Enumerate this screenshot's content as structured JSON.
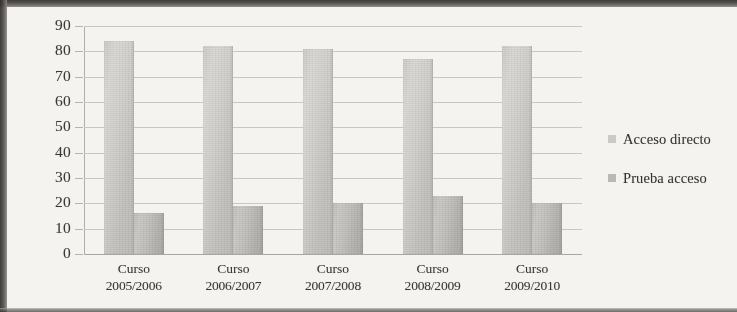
{
  "chart_data": {
    "type": "bar",
    "title": "",
    "xlabel": "",
    "ylabel": "",
    "ylim": [
      0,
      90
    ],
    "ytick_step": 10,
    "yticks": [
      90,
      80,
      70,
      60,
      50,
      40,
      30,
      20,
      10,
      0
    ],
    "grid": true,
    "legend_position": "right",
    "categories": [
      "Curso 2005/2006",
      "Curso 2006/2007",
      "Curso 2007/2008",
      "Curso 2008/2009",
      "Curso 2009/2010"
    ],
    "category_lines": [
      {
        "line1": "Curso",
        "line2": "2005/2006"
      },
      {
        "line1": "Curso",
        "line2": "2006/2007"
      },
      {
        "line1": "Curso",
        "line2": "2007/2008"
      },
      {
        "line1": "Curso",
        "line2": "2008/2009"
      },
      {
        "line1": "Curso",
        "line2": "2009/2010"
      }
    ],
    "series": [
      {
        "name": "Acceso directo",
        "color": "#cbcac6",
        "values": [
          84,
          82,
          81,
          77,
          82
        ]
      },
      {
        "name": "Prueba acceso",
        "color": "#b9b8b4",
        "values": [
          16,
          19,
          20,
          23,
          20
        ]
      }
    ]
  },
  "legend": {
    "items": [
      {
        "label": "Acceso directo",
        "swatch": "legend-swatch-acceso-directo"
      },
      {
        "label": "Prueba acceso",
        "swatch": "legend-swatch-prueba-acceso"
      }
    ]
  }
}
